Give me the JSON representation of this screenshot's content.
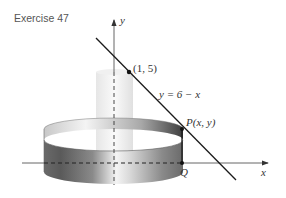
{
  "title": "Exercise 47",
  "axes": {
    "x_label": "x",
    "y_label": "y"
  },
  "line": {
    "equation": "y = 6 − x",
    "point_label": "(1, 5)"
  },
  "points": {
    "P_label": "P(x, y)",
    "Q_label": "Q"
  },
  "colors": {
    "ink": "#222222",
    "axis": "#555555",
    "shell_dark": "#4a4a4a",
    "shell_light": "#e8e8e8",
    "inner_cylinder": "#f2f2f2"
  }
}
